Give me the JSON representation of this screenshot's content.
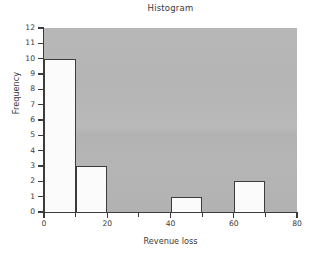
{
  "chart_data": {
    "type": "bar",
    "title": "Histogram",
    "xlabel": "Revenue loss",
    "ylabel": "Frequency",
    "bin_edges": [
      0,
      10,
      20,
      30,
      40,
      50,
      60,
      70,
      80
    ],
    "categories": [
      "0-10",
      "10-20",
      "20-30",
      "30-40",
      "40-50",
      "50-60",
      "60-70",
      "70-80"
    ],
    "values": [
      10,
      3,
      0,
      0,
      1,
      0,
      2,
      0
    ],
    "bars": [
      {
        "x0": 0,
        "x1": 10,
        "height": 10
      },
      {
        "x0": 10,
        "x1": 20,
        "height": 3
      },
      {
        "x0": 40,
        "x1": 50,
        "height": 1
      },
      {
        "x0": 60,
        "x1": 70,
        "height": 2
      }
    ],
    "xlim": [
      0,
      80
    ],
    "ylim": [
      0,
      12
    ],
    "xticks": [
      0,
      20,
      40,
      60,
      80
    ],
    "xtick_labels": [
      "0",
      "20",
      "40",
      "60",
      "80"
    ],
    "xminor_ticks": [
      10,
      30,
      50,
      70
    ],
    "yticks": [
      0,
      1,
      2,
      3,
      4,
      5,
      6,
      7,
      8,
      9,
      10,
      11,
      12
    ],
    "ytick_labels": [
      "0",
      "1",
      "2",
      "3",
      "4",
      "5",
      "6",
      "7",
      "8",
      "9",
      "10",
      "11",
      "12"
    ],
    "grid": false,
    "legend": null,
    "colors": {
      "plot_background": "#b5b5b5",
      "bar_fill": "#fbfbfb",
      "bar_edge": "#3c3c3c",
      "axis": "#3c3c3c",
      "text": "#3a3a3a",
      "figure_background": "#ffffff"
    }
  }
}
